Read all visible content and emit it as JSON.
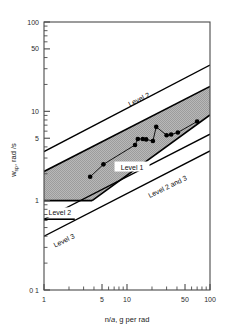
{
  "chart_data": {
    "type": "scatter",
    "title": "",
    "subtitle": "",
    "xlabel": "n/a,  g per rad",
    "xlabel_parts": {
      "symbol": "n/",
      "alpha": "a",
      "units": ",   g per rad"
    },
    "ylabel": "w_sp,  rad /s",
    "ylabel_parts": {
      "symbol": "w",
      "subscript": "sp",
      "units": ",  rad /s"
    },
    "xscale": "log",
    "yscale": "log",
    "xlim": [
      1,
      100
    ],
    "ylim": [
      0.1,
      100
    ],
    "grid": false,
    "legend_position": "in-plot-annotations",
    "xticks": [
      1,
      5,
      10,
      50,
      100
    ],
    "xtick_labels": [
      "1",
      "5",
      "10",
      "50",
      "100"
    ],
    "xminor_ticks": [
      2,
      3,
      4,
      6,
      7,
      8,
      9,
      20,
      30,
      40,
      60,
      70,
      80,
      90
    ],
    "yticks": [
      0.1,
      1,
      5,
      10,
      50,
      100
    ],
    "ytick_labels": [
      "0 1",
      "1",
      "5",
      "10",
      "50",
      "100"
    ],
    "yminor_ticks": [
      0.2,
      0.3,
      0.4,
      0.5,
      0.6,
      0.7,
      0.8,
      0.9,
      2,
      3,
      4,
      6,
      7,
      8,
      9,
      20,
      30,
      40,
      60,
      70,
      80,
      90
    ],
    "series": [
      {
        "name": "flight test data",
        "marker": "filled-circle",
        "color": "#000000",
        "points": [
          {
            "x": 3.6,
            "y": 1.85
          },
          {
            "x": 5.2,
            "y": 2.55
          },
          {
            "x": 12.5,
            "y": 4.2
          },
          {
            "x": 13.5,
            "y": 4.9
          },
          {
            "x": 15.5,
            "y": 4.9
          },
          {
            "x": 17.0,
            "y": 4.85
          },
          {
            "x": 20.5,
            "y": 4.65
          },
          {
            "x": 22.5,
            "y": 6.7
          },
          {
            "x": 30.0,
            "y": 5.4
          },
          {
            "x": 34.0,
            "y": 5.5
          },
          {
            "x": 41.0,
            "y": 5.8
          },
          {
            "x": 70.0,
            "y": 7.7
          }
        ]
      }
    ],
    "bands": [
      {
        "name": "Level 1",
        "label": "Level 1",
        "fill": "#b4b4b4",
        "upper_boundary": {
          "x": [
            1,
            100
          ],
          "y": [
            2.12,
            19.0
          ]
        },
        "lower_boundary": {
          "x": [
            1,
            100
          ],
          "y": [
            1.0,
            9.1
          ]
        },
        "lower_floor": 1.0,
        "floor_from_x": 1,
        "floor_to_x": 3.8
      }
    ],
    "boundary_lines": [
      {
        "name": "Level 2 upper",
        "label": "Level 2",
        "x": [
          1,
          100
        ],
        "y": [
          3.55,
          33.0
        ]
      },
      {
        "name": "Level 2 lower",
        "label": "Level 2",
        "x": [
          1,
          100
        ],
        "y": [
          0.62,
          0.62
        ],
        "style": "horizontal-left-segment",
        "x_end": 2.35
      },
      {
        "name": "Level 2 and 3",
        "label": "Level 2 and 3",
        "x": [
          1,
          100
        ],
        "y": [
          0.62,
          5.55
        ]
      },
      {
        "name": "Level 3",
        "label": "Level 3",
        "x": [
          1,
          100
        ],
        "y": [
          0.4,
          3.6
        ]
      }
    ],
    "annotations": [
      {
        "text": "Level 2",
        "x": 14.0,
        "y": 13.5,
        "rotation": -26,
        "boxed": false
      },
      {
        "text": "Level 1",
        "x": 11.5,
        "y": 2.35,
        "rotation": 0,
        "boxed": true
      },
      {
        "text": "Level 2 and 3",
        "x": 31.0,
        "y": 1.42,
        "rotation": -26,
        "boxed": false
      },
      {
        "text": "Level 2",
        "x": 1.55,
        "y": 0.72,
        "rotation": 0,
        "boxed": true
      },
      {
        "text": "Level 3",
        "x": 1.75,
        "y": 0.355,
        "rotation": -26,
        "boxed": false
      }
    ]
  },
  "axes": {
    "frame_color": "#4a4a4a",
    "data_color": "#000000",
    "band_fill": "#b4b4b4"
  }
}
